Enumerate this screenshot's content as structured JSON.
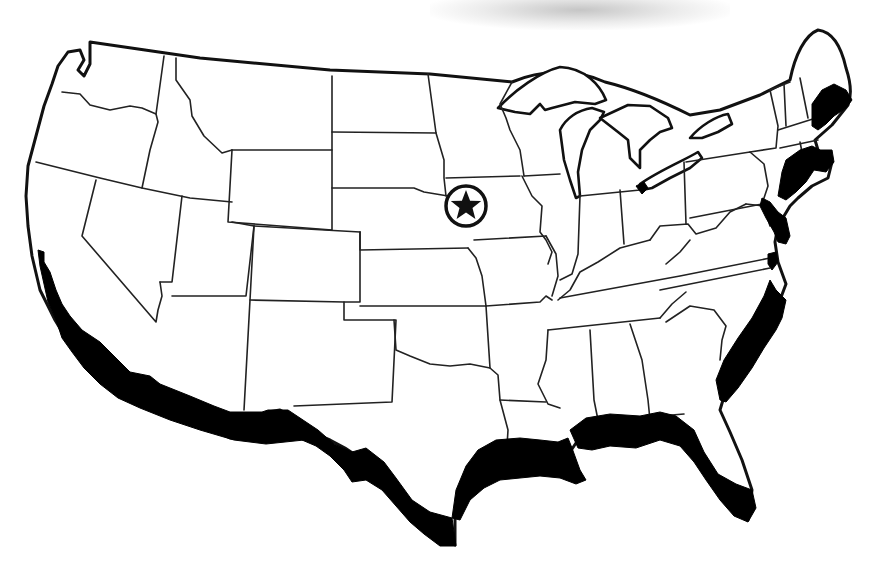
{
  "map": {
    "subject": "Contiguous United States outline map with state borders",
    "colors": {
      "background": "#ffffff",
      "outline": "#111111",
      "highlight_fill": "#000000",
      "smudge": "#a0a0a0"
    },
    "marker": {
      "type": "star-in-circle",
      "location_description": "western Iowa, near the Nebraska border",
      "x": 466,
      "y": 206
    },
    "highlighted_regions": [
      "Southern California Pacific coast",
      "Gulf of Mexico coast (Texas to Florida)",
      "Florida Atlantic coast",
      "Southeast Atlantic coast (Georgia to North Carolina)",
      "Mid-Atlantic coast (Virginia, Maryland, Delaware, New Jersey)",
      "Northeast coast (New York, Connecticut, Rhode Island, Massachusetts)",
      "Coastal New Hampshire and southern Maine",
      "Lake Erie western tip"
    ]
  }
}
